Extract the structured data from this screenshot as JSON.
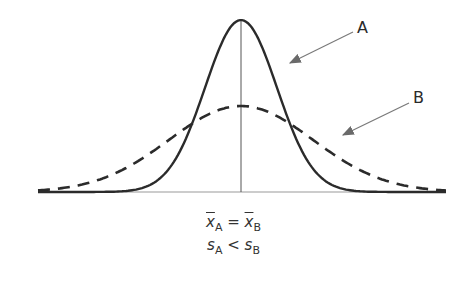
{
  "diagram": {
    "title": "",
    "curves": [
      {
        "label": "A",
        "style": "solid",
        "description": "narrow normal distribution, smaller standard deviation"
      },
      {
        "label": "B",
        "style": "dashed",
        "description": "wide normal distribution, larger standard deviation"
      }
    ],
    "labels": {
      "curve_a": "A",
      "curve_b": "B"
    },
    "equations": {
      "line1": {
        "lhs_var": "x",
        "lhs_sub": "A",
        "op": "=",
        "rhs_var": "x",
        "rhs_sub": "B"
      },
      "line2": {
        "lhs_var": "s",
        "lhs_sub": "A",
        "op": "<",
        "rhs_var": "s",
        "rhs_sub": "B"
      }
    },
    "colors": {
      "curve": "#2b2b2b",
      "arrow": "#7a7a7a",
      "axis": "#888888"
    }
  }
}
